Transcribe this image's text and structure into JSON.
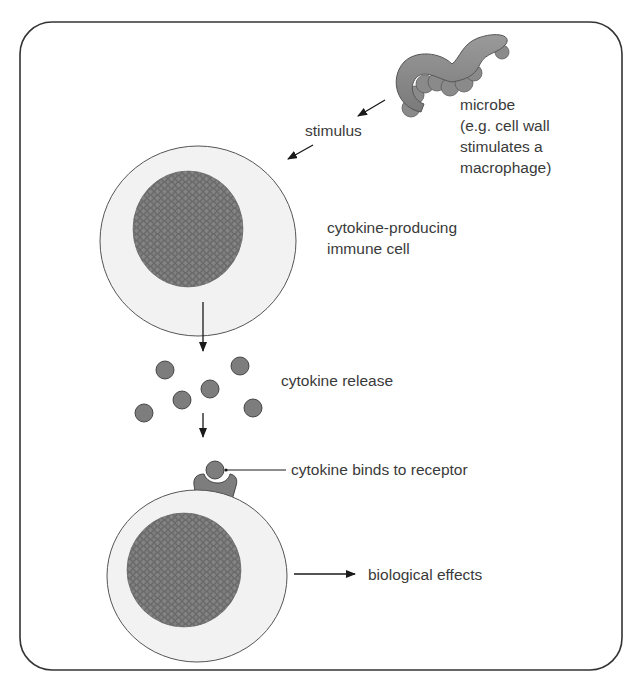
{
  "diagram": {
    "labels": {
      "stimulus": "stimulus",
      "microbe_line1": "microbe",
      "microbe_line2": "(e.g. cell wall",
      "microbe_line3": "stimulates a",
      "microbe_line4": "macrophage)",
      "producing_cell_line1": "cytokine-producing",
      "producing_cell_line2": "immune cell",
      "release": "cytokine release",
      "binding": "cytokine binds to receptor",
      "effects": "biological effects"
    },
    "colors": {
      "border": "#333333",
      "cell_fill": "#f2f2f2",
      "cell_outline": "#555555",
      "nucleus_fill": "#6e6e6e",
      "granule": "#8a8a8a",
      "cytokine_fill": "#7d7d7d",
      "microbe_fill": "#8c8c8c",
      "text": "#3a3a3a",
      "arrow": "#1a1a1a"
    },
    "cytokine_count": 6
  }
}
